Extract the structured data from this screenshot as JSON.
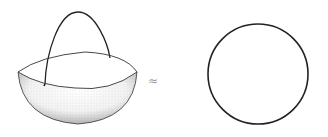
{
  "figure": {
    "left": {
      "label": "hemisphere-with-handle-loop"
    },
    "relation": {
      "symbol": "≈"
    },
    "right": {
      "label": "circle"
    }
  },
  "colors": {
    "stroke": "#222222",
    "stipple": "#555555",
    "background": "#ffffff"
  }
}
